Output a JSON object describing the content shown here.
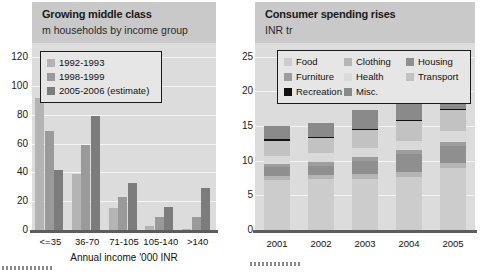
{
  "left": {
    "title": "Growing middle class",
    "subtitle": "m households by income group",
    "axis_title": "Annual income '000 INR",
    "legend": [
      {
        "label": "1992-1993",
        "color": "#b4b4b4"
      },
      {
        "label": "1998-1999",
        "color": "#9a9a9a"
      },
      {
        "label": "2005-2006 (estimate)",
        "color": "#7c7c7c"
      }
    ],
    "yticks": [
      "0",
      "20",
      "40",
      "60",
      "80",
      "100",
      "120"
    ]
  },
  "right": {
    "title": "Consumer spending rises",
    "subtitle": "INR tr",
    "legend": [
      {
        "label": "Food",
        "color": "#cccccc"
      },
      {
        "label": "Clothing",
        "color": "#b5b5b5"
      },
      {
        "label": "Housing",
        "color": "#8f8f8f"
      },
      {
        "label": "Furniture",
        "color": "#9d9d9d"
      },
      {
        "label": "Health",
        "color": "#d9d9d9"
      },
      {
        "label": "Transport",
        "color": "#c2c2c2"
      },
      {
        "label": "Recreation",
        "color": "#111111"
      },
      {
        "label": "Misc.",
        "color": "#8a8a8a"
      }
    ],
    "yticks": [
      "0",
      "5",
      "10",
      "15",
      "20",
      "25"
    ]
  },
  "chart_data": [
    {
      "type": "bar",
      "title": "Growing middle class",
      "subtitle": "m households by income group",
      "xlabel": "Annual income '000 INR",
      "ylabel": "m households",
      "ylim": [
        0,
        130
      ],
      "yticks": [
        0,
        20,
        40,
        60,
        80,
        100,
        120
      ],
      "grid": true,
      "legend_position": "top-left",
      "categories": [
        "<=35",
        "36-70",
        "71-105",
        "105-140",
        ">140"
      ],
      "series": [
        {
          "name": "1992-1993",
          "color": "#b4b4b4",
          "values": [
            92,
            39,
            15,
            3,
            1
          ]
        },
        {
          "name": "1998-1999",
          "color": "#9a9a9a",
          "values": [
            69,
            59,
            23,
            9,
            9
          ]
        },
        {
          "name": "2005-2006 (estimate)",
          "color": "#7c7c7c",
          "values": [
            42,
            79,
            33,
            16,
            29
          ]
        }
      ]
    },
    {
      "type": "bar",
      "stacked": true,
      "title": "Consumer spending rises",
      "subtitle": "INR tr",
      "xlabel": "",
      "ylabel": "INR tr",
      "ylim": [
        0,
        27
      ],
      "yticks": [
        0,
        5,
        10,
        15,
        20,
        25
      ],
      "grid": true,
      "legend_position": "top",
      "categories": [
        "2001",
        "2002",
        "2003",
        "2004",
        "2005"
      ],
      "series": [
        {
          "name": "Food",
          "color": "#cccccc",
          "values": [
            7.2,
            7.3,
            7.4,
            7.7,
            9.0
          ]
        },
        {
          "name": "Clothing",
          "color": "#b5b5b5",
          "values": [
            0.6,
            0.6,
            0.7,
            0.7,
            0.7
          ]
        },
        {
          "name": "Housing",
          "color": "#8f8f8f",
          "values": [
            1.3,
            1.4,
            1.9,
            2.6,
            2.4
          ]
        },
        {
          "name": "Furniture",
          "color": "#9d9d9d",
          "values": [
            0.5,
            0.5,
            0.5,
            0.5,
            0.6
          ]
        },
        {
          "name": "Health",
          "color": "#d9d9d9",
          "values": [
            1.1,
            1.3,
            1.3,
            1.4,
            1.6
          ]
        },
        {
          "name": "Transport",
          "color": "#c2c2c2",
          "values": [
            2.2,
            2.2,
            2.6,
            2.8,
            3.0
          ]
        },
        {
          "name": "Recreation",
          "color": "#111111",
          "values": [
            0.2,
            0.2,
            0.2,
            0.2,
            0.2
          ]
        },
        {
          "name": "Misc.",
          "color": "#8a8a8a",
          "values": [
            1.9,
            1.9,
            2.8,
            3.1,
            3.4
          ]
        }
      ],
      "totals": [
        15.0,
        15.4,
        17.4,
        19.0,
        20.9
      ]
    }
  ]
}
